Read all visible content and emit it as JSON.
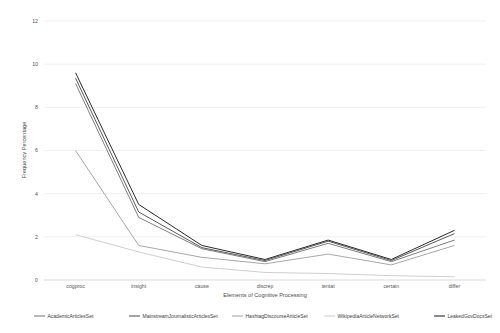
{
  "chart_data": {
    "type": "line",
    "title": "",
    "xlabel": "Elements of Cognitive Processing",
    "ylabel": "Frequency Percentage",
    "categories": [
      "cogproc",
      "insight",
      "cause",
      "discrep",
      "tentat",
      "certain",
      "differ"
    ],
    "ylim": [
      0,
      12
    ],
    "yticks": [
      0,
      2,
      4,
      6,
      8,
      10,
      12
    ],
    "ytick_labels": [
      "0",
      "2",
      "4",
      "6",
      "8",
      "10",
      "12"
    ],
    "grid": true,
    "grid_axis": "y",
    "legend_position": "bottom",
    "series": [
      {
        "name": "AcademicArticlesSet",
        "color": "#7f7f7f",
        "values": [
          9.1,
          2.9,
          1.45,
          0.85,
          1.7,
          0.85,
          1.85
        ]
      },
      {
        "name": "MainstreamJournalisticArticlesSet",
        "color": "#5a5a5a",
        "values": [
          9.35,
          3.15,
          1.5,
          0.9,
          1.8,
          0.9,
          2.15
        ]
      },
      {
        "name": "HashtagDiscourseArticleSet",
        "color": "#a8a8a8",
        "values": [
          6.0,
          1.6,
          1.05,
          0.75,
          1.2,
          0.7,
          1.6
        ]
      },
      {
        "name": "WikipediaArticleNetworkSet",
        "color": "#cfcfcf",
        "values": [
          2.1,
          1.3,
          0.6,
          0.35,
          0.3,
          0.2,
          0.15
        ]
      },
      {
        "name": "LeakedGovDocsSet",
        "color": "#2b2b2b",
        "values": [
          9.6,
          3.5,
          1.6,
          0.95,
          1.85,
          0.95,
          2.3
        ]
      }
    ]
  },
  "legend": {
    "items": [
      {
        "label": "AcademicArticlesSet"
      },
      {
        "label": "MainstreamJournalisticArticlesSet"
      },
      {
        "label": "HashtagDiscourseArticleSet"
      },
      {
        "label": "WikipediaArticleNetworkSet"
      },
      {
        "label": "LeakedGovDocsSet"
      }
    ]
  }
}
